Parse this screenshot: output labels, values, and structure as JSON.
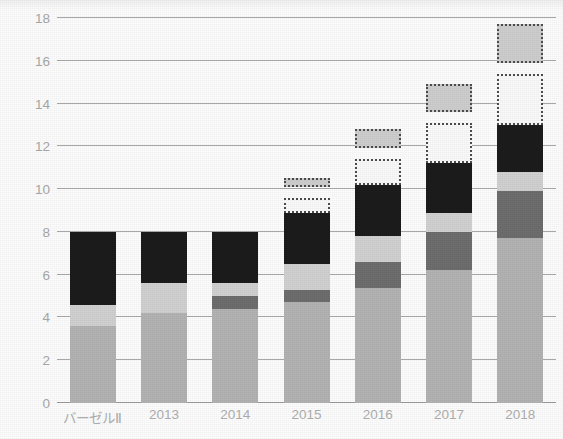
{
  "chart_data": {
    "type": "bar",
    "title": "",
    "subtitle": "",
    "xlabel": "",
    "ylabel": "",
    "stacked": true,
    "grid": true,
    "legend_position": "none",
    "ylim": [
      0,
      18
    ],
    "yticks": [
      0,
      2,
      4,
      6,
      8,
      10,
      12,
      14,
      16,
      18
    ],
    "ytick_labels": [
      "0",
      "2",
      "4",
      "6",
      "8",
      "10",
      "12",
      "14",
      "16",
      "18"
    ],
    "categories": [
      "バーゼルⅡ",
      "2013",
      "2014",
      "2015",
      "2016",
      "2017",
      "2018"
    ],
    "series": [
      {
        "name": "medium-gray-base",
        "color": "#b4b4b4",
        "style": "solid",
        "values": [
          3.6,
          4.2,
          4.4,
          4.7,
          5.4,
          6.2,
          7.7
        ]
      },
      {
        "name": "dark-gray-buffer",
        "color": "#6e6e6e",
        "style": "solid",
        "values": [
          0.0,
          0.0,
          0.6,
          0.6,
          1.2,
          1.8,
          2.2
        ]
      },
      {
        "name": "light-gray-band",
        "color": "#d2d2d2",
        "style": "solid",
        "values": [
          1.0,
          1.4,
          0.6,
          1.2,
          1.2,
          0.9,
          0.9
        ]
      },
      {
        "name": "black-top",
        "color": "#1c1c1c",
        "style": "solid",
        "values": [
          3.4,
          2.4,
          2.4,
          2.4,
          2.4,
          2.3,
          2.2
        ]
      },
      {
        "name": "white-dotted-box",
        "color": "#fbfbfb",
        "style": "dotted",
        "values": [
          0.0,
          0.0,
          0.0,
          0.7,
          1.2,
          1.9,
          2.4
        ]
      },
      {
        "name": "gray-dotted-box",
        "color": "#cfcfcf",
        "style": "dotted",
        "floating": true,
        "gap_below": 0.5,
        "values": [
          0.0,
          0.0,
          0.0,
          0.4,
          0.9,
          1.3,
          1.8
        ]
      }
    ],
    "bar_totals": [
      8.0,
      8.0,
      8.0,
      9.6,
      11.4,
      13.1,
      15.4
    ],
    "bar_tops_with_floating": [
      8.0,
      8.0,
      8.0,
      10.5,
      12.4,
      14.4,
      16.7
    ]
  },
  "axes": {
    "x_tick_labels": [
      "バーゼルⅡ",
      "2013",
      "2014",
      "2015",
      "2016",
      "2017",
      "2018"
    ],
    "y_tick_labels": [
      "18",
      "16",
      "14",
      "12",
      "10",
      "8",
      "6",
      "4",
      "2",
      "0"
    ]
  },
  "colors": {
    "gridline": "#9b9b9b",
    "axis": "#8a8a8a",
    "tick_text": "#a9a9a9",
    "background": "#fefefe"
  }
}
